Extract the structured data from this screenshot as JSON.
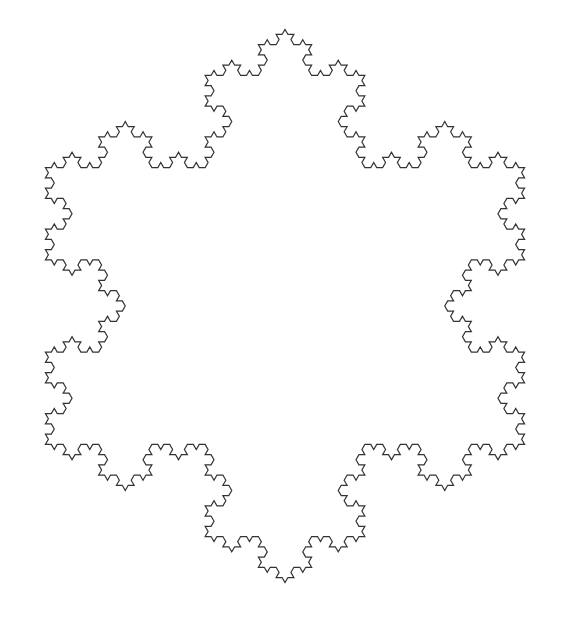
{
  "figure": {
    "type": "koch-snowflake",
    "iterations": 4,
    "center": [
      285,
      306
    ],
    "vertex_radius": 318,
    "first_vertex_angle_deg": -90,
    "stroke_color": "#333333",
    "stroke_width": 1.2,
    "background": "#ffffff",
    "clip_right": 533
  }
}
